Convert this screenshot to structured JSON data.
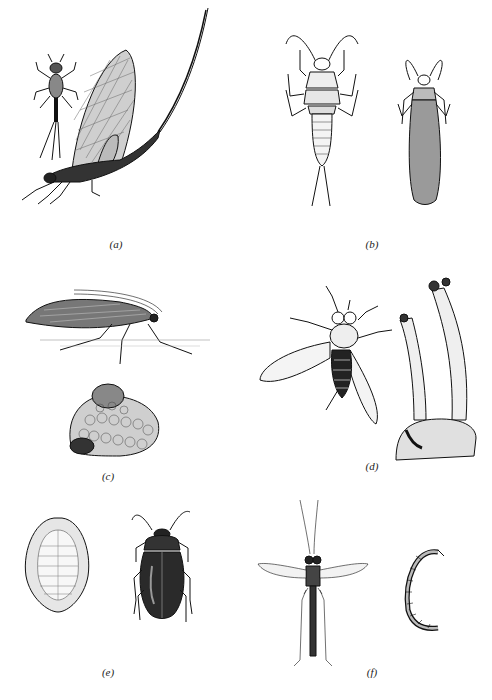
{
  "figure": {
    "background": "#ffffff",
    "ink": "#111111",
    "panels": [
      {
        "id": "a",
        "label": "(a)",
        "subjects": [
          "mayfly nymph",
          "adult mayfly with long tail filaments"
        ]
      },
      {
        "id": "b",
        "label": "(b)",
        "subjects": [
          "stonefly nymph",
          "adult stonefly with folded wings"
        ]
      },
      {
        "id": "c",
        "label": "(c)",
        "subjects": [
          "adult caddisfly on surface",
          "caddisfly larval case of pebbles"
        ]
      },
      {
        "id": "d",
        "label": "(d)",
        "subjects": [
          "adult black fly",
          "black fly larvae attached to rock"
        ]
      },
      {
        "id": "e",
        "label": "(e)",
        "subjects": [
          "water-penny beetle larva",
          "adult riffle beetle"
        ]
      },
      {
        "id": "f",
        "label": "(f)",
        "subjects": [
          "adult midge",
          "midge larva"
        ]
      }
    ]
  }
}
